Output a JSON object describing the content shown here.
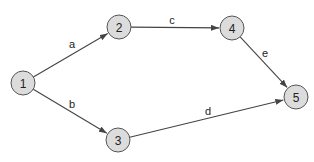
{
  "diagram": {
    "type": "directed-network",
    "nodes": [
      {
        "id": "1",
        "label": "1",
        "x": 23,
        "y": 83
      },
      {
        "id": "2",
        "label": "2",
        "x": 119,
        "y": 27
      },
      {
        "id": "3",
        "label": "3",
        "x": 118,
        "y": 140
      },
      {
        "id": "4",
        "label": "4",
        "x": 232,
        "y": 28
      },
      {
        "id": "5",
        "label": "5",
        "x": 296,
        "y": 97
      }
    ],
    "edges": [
      {
        "from": "1",
        "to": "2",
        "label": "a",
        "lx": 72,
        "ly": 44
      },
      {
        "from": "1",
        "to": "3",
        "label": "b",
        "lx": 72,
        "ly": 104
      },
      {
        "from": "2",
        "to": "4",
        "label": "c",
        "lx": 172,
        "ly": 20
      },
      {
        "from": "3",
        "to": "5",
        "label": "d",
        "lx": 208,
        "ly": 111
      },
      {
        "from": "4",
        "to": "5",
        "label": "e",
        "lx": 265,
        "ly": 53
      }
    ],
    "node_radius": 12,
    "colors": {
      "node_fill": "#dcdcdc",
      "node_stroke": "#555555",
      "edge": "#444444",
      "text": "#222222"
    }
  }
}
